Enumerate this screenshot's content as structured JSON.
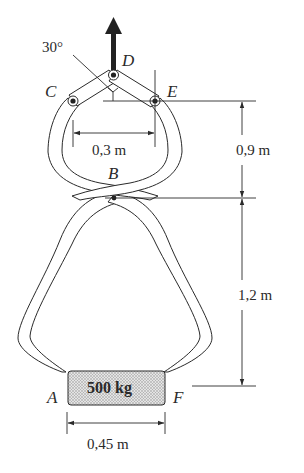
{
  "diagram": {
    "type": "mechanism",
    "points": {
      "A": "A",
      "B": "B",
      "C": "C",
      "D": "D",
      "E": "E",
      "F": "F"
    },
    "angle_label": "30°",
    "load_label": "500 kg",
    "dimensions": {
      "ce_width": "0,3 m",
      "upper_height": "0,9 m",
      "lower_height": "1,2 m",
      "block_width": "0,45 m"
    },
    "colors": {
      "stroke": "#2a2a2a",
      "arm_fill": "#ffffff",
      "block_fill": "#cfcfcf",
      "force_arrow": "#222222"
    }
  }
}
